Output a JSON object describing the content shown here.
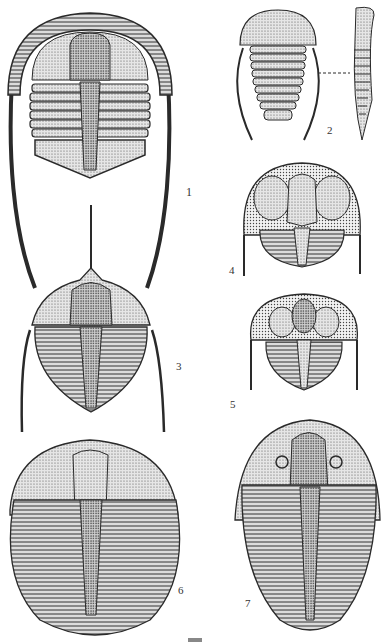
{
  "plate": {
    "title": "Trilobite illustration plate",
    "page_number_partial": "73",
    "figures": [
      {
        "id": "1",
        "label": "1",
        "description": "Trilobite with broad fringed cephalon and very long genal spines"
      },
      {
        "id": "2",
        "label": "2",
        "description": "Small trilobite, dorsal and lateral views joined by dashed line"
      },
      {
        "id": "3",
        "label": "3",
        "description": "Trilobite with long median cephalic spine and long genal spines"
      },
      {
        "id": "4",
        "label": "4",
        "description": "Trinucleid-type trilobite with pitted fringe"
      },
      {
        "id": "5",
        "label": "5",
        "description": "Trinucleid-type trilobite with pitted fringe, smaller glabella"
      },
      {
        "id": "6",
        "label": "6",
        "description": "Large oval trilobite with many thoracic segments"
      },
      {
        "id": "7",
        "label": "7",
        "description": "Oval trilobite with crescent eyes and tapering pygidium"
      }
    ]
  },
  "colors": {
    "ink": "#2a2a2a",
    "stipple": "#8a8a8a",
    "background": "#ffffff"
  }
}
